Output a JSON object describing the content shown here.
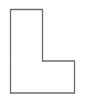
{
  "shape": {
    "name": "L-shape",
    "stroke": "#6e6e6e",
    "fill": "#ffffff",
    "stroke_width": 1.3,
    "points": "10.5,9.5 42.5,9.5 42.5,61 74.5,61 74.5,93 10.5,93"
  }
}
